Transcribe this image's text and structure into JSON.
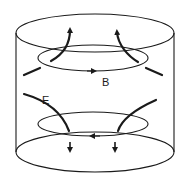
{
  "diagram": {
    "labels": {
      "magnetic_field": "B",
      "electric_field": "E"
    },
    "colors": {
      "line": "#1a1a1a",
      "background": "#ffffff"
    }
  }
}
